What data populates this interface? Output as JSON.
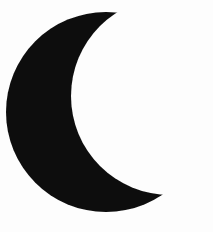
{
  "image": {
    "subject": "crescent-moon",
    "style": "solid-silhouette-clipart",
    "width": 213,
    "height": 232,
    "background_color": "#fdfdfd",
    "shape_color": "#0d0d0d",
    "orientation": "opening-to-the-right",
    "text_content": "",
    "alt_text": "Solid black crescent moon silhouette on a white background"
  },
  "shape_data": {
    "type": "crescent",
    "outer_arc": {
      "description": "large convex circle forming the left/outer limb of the moon",
      "center": [
        106,
        112
      ],
      "radius": 100,
      "leftmost_point": [
        13,
        120
      ],
      "bottom_point": [
        105,
        217
      ],
      "top_horn_tip": [
        96,
        4
      ],
      "bottom_horn_tip": [
        199,
        186
      ]
    },
    "inner_arc": {
      "description": "concave circle cut out of the right side producing the crescent",
      "center": [
        170,
        96
      ],
      "radius": 99,
      "sample_points": [
        [
          75,
          30
        ],
        [
          71,
          90
        ],
        [
          95,
          140
        ],
        [
          140,
          172
        ]
      ]
    },
    "path": "M 96 4 C 66 14 36 44 20 82 C 6 116 10 154 30 183 C 52 213 90 224 124 216 C 158 208 183 186 199 186 C 170 180 140 172 118 156 C 92 137 75 112 71 84 C 68 56 78 27 96 4 Z"
  },
  "colors": {
    "foreground": "#0d0d0d",
    "background": "#fdfdfd"
  }
}
